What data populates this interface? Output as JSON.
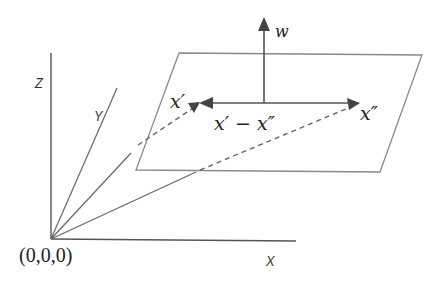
{
  "figure": {
    "type": "3d-vector-diagram"
  },
  "axes": {
    "x_label": "X",
    "y_label": "Y",
    "z_label": "Z",
    "origin_label": "(0,0,0)"
  },
  "plane": {
    "corners": [
      [
        179,
        53
      ],
      [
        422,
        55
      ],
      [
        380,
        172
      ],
      [
        136,
        170
      ]
    ]
  },
  "vectors": {
    "normal_label": "w",
    "point_a_label": "x′",
    "point_b_label": "x″",
    "difference_label": "x′ − x″"
  },
  "colors": {
    "line": "#555555",
    "plane": "#8a8a8a",
    "arrow": "#444444",
    "text": "#222222"
  }
}
